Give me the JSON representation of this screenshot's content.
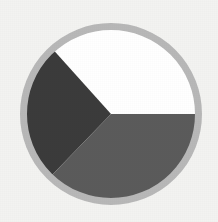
{
  "figure": {
    "background_color": "#f3f3f1",
    "canvas_width": 218,
    "canvas_height": 222
  },
  "chart_data": {
    "type": "pie",
    "title": "",
    "subtitle": "",
    "xlabel": "",
    "ylabel": "",
    "grid": false,
    "legend": "none",
    "labels_shown": false,
    "center_x": 111,
    "center_y": 114,
    "radius": 88,
    "ring": {
      "stroke_color": "#b8b8b8",
      "stroke_width": 7,
      "outer_radius": 91
    },
    "start_angle_deg": 0,
    "direction": "counterclockwise",
    "categories": [
      "Slice A",
      "Slice B",
      "Slice C"
    ],
    "values": [
      36.7,
      26.1,
      37.2
    ],
    "percents": [
      "36.7%",
      "26.1%",
      "37.2%"
    ],
    "angles_deg": [
      132,
      94,
      134
    ],
    "colors": [
      "#ffffff",
      "#3b3b3b",
      "#5b5b5b"
    ],
    "slices": [
      {
        "name": "Slice A",
        "value": 36.7,
        "percent": "36.7%",
        "color": "#ffffff",
        "start_deg": 0,
        "end_deg": 132
      },
      {
        "name": "Slice B",
        "value": 26.1,
        "percent": "26.1%",
        "color": "#3b3b3b",
        "start_deg": 132,
        "end_deg": 226
      },
      {
        "name": "Slice C",
        "value": 37.2,
        "percent": "37.2%",
        "color": "#5b5b5b",
        "start_deg": 226,
        "end_deg": 360
      }
    ]
  }
}
